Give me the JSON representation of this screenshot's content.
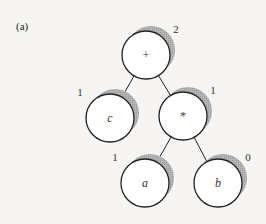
{
  "figure_label": "(a)",
  "tree": {
    "nodes": [
      {
        "id": "root",
        "symbol": "+",
        "rank": "2",
        "cx": 146,
        "cy": 55,
        "italic": false
      },
      {
        "id": "c",
        "symbol": "c",
        "rank": "1",
        "cx": 110,
        "cy": 118,
        "italic": true
      },
      {
        "id": "mul",
        "symbol": "*",
        "rank": "1",
        "cx": 183,
        "cy": 116,
        "italic": false
      },
      {
        "id": "a",
        "symbol": "a",
        "rank": "1",
        "cx": 145,
        "cy": 183,
        "italic": true
      },
      {
        "id": "b",
        "symbol": "b",
        "rank": "0",
        "cx": 218,
        "cy": 183,
        "italic": true
      }
    ],
    "edges": [
      [
        "root",
        "c"
      ],
      [
        "root",
        "mul"
      ],
      [
        "mul",
        "a"
      ],
      [
        "mul",
        "b"
      ]
    ]
  }
}
